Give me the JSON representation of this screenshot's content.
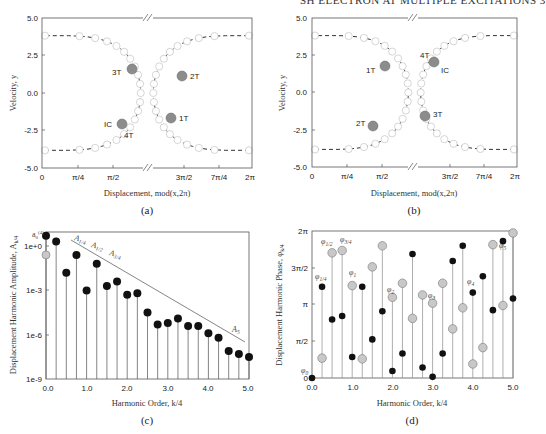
{
  "header": {
    "running_title": "SH ELECTRON AT MULTIPLE EXCITATIONS 3"
  },
  "chart_data": [
    {
      "id": "a",
      "type": "scatter",
      "caption": "(a)",
      "xlabel": "Displacement, mod(x,2π)",
      "ylabel": "Velocity, y",
      "xticks": [
        "0",
        "π/4",
        "π/2",
        "3π/2",
        "7π/4",
        "2π"
      ],
      "yticks": [
        "5.0",
        "2.5",
        "0.0",
        "-2.5",
        "-5.0"
      ],
      "ylim": [
        -5.0,
        5.0
      ],
      "axis_break": true,
      "series": [
        {
          "name": "trajectory (open circles, dashed)",
          "style": "open-circle"
        },
        {
          "name": "Poincaré points",
          "style": "filled-gray"
        }
      ],
      "labels": [
        {
          "text": "3T",
          "x": "≈π/2+0.3",
          "y": 1.6
        },
        {
          "text": "2T",
          "x": "≈3π/2+0.2",
          "y": 2.3
        },
        {
          "text": "IC",
          "x": "≈π/2+0.1",
          "y": -2.0
        },
        {
          "text": "4T",
          "x": "≈π/2+0.1",
          "y": -2.0
        },
        {
          "text": "1T",
          "x": "≈3π/2-0.1",
          "y": -1.7
        }
      ]
    },
    {
      "id": "b",
      "type": "scatter",
      "caption": "(b)",
      "xlabel": "Displacement, mod(x,2π)",
      "ylabel": "Velocity, y",
      "xticks": [
        "0",
        "π/4",
        "π/2",
        "3π/2",
        "7π/4",
        "2π"
      ],
      "yticks": [
        "5.0",
        "2.5",
        "0.0",
        "-2.5",
        "-5.0"
      ],
      "ylim": [
        -5.0,
        5.0
      ],
      "axis_break": true,
      "labels": [
        {
          "text": "1T",
          "x": "≈π/2",
          "y": 1.7
        },
        {
          "text": "4T",
          "x": "≈3π/2-0.1",
          "y": 2.1
        },
        {
          "text": "IC",
          "x": "≈3π/2-0.1",
          "y": 2.1
        },
        {
          "text": "2T",
          "x": "≈π/2-0.2",
          "y": -2.2
        },
        {
          "text": "3T",
          "x": "≈3π/2-0.4",
          "y": -1.6
        }
      ]
    },
    {
      "id": "c",
      "type": "stem",
      "caption": "(c)",
      "xlabel": "Harmonic Order, k/4",
      "ylabel": "Displacement Harmonic Amplitude, A_k/4",
      "xticks": [
        "0.0",
        "1.0",
        "2.0",
        "3.0",
        "4.0",
        "5.0"
      ],
      "yticks": [
        "1e+0",
        "1e-3",
        "1e-6",
        "1e-9"
      ],
      "yscale": "log",
      "ylim": [
        1e-09,
        10
      ],
      "x": [
        0.0,
        0.25,
        0.5,
        0.75,
        1.0,
        1.25,
        1.5,
        1.75,
        2.0,
        2.25,
        2.5,
        2.75,
        3.0,
        3.25,
        3.5,
        3.75,
        4.0,
        4.25,
        4.5,
        4.75,
        5.0
      ],
      "log10_values": [
        0.7,
        0.3,
        -1.8,
        -0.6,
        -3.0,
        -1.2,
        -2.7,
        -2.4,
        -3.3,
        -3.2,
        -4.5,
        -5.3,
        -5.2,
        -4.9,
        -5.4,
        -5.4,
        -5.9,
        -6.2,
        -7.1,
        -7.3,
        -7.5
      ],
      "extra_point": {
        "x": 0.0,
        "log10_value": -0.6,
        "style": "gray",
        "label": "a0^(4)"
      },
      "annotations": [
        "A_1/4",
        "A_1/2",
        "A_3/4",
        "A_5"
      ],
      "trend_line": {
        "from": [
          0.55,
          0.3
        ],
        "to": [
          4.95,
          -6.3
        ]
      }
    },
    {
      "id": "d",
      "type": "stem",
      "caption": "(d)",
      "xlabel": "Harmonic Order, k/4",
      "ylabel": "Displacement Harmonic Phase, φ_k/4",
      "xticks": [
        "0.0",
        "1.0",
        "2.0",
        "3.0",
        "4.0",
        "5.0"
      ],
      "yticks": [
        "2π",
        "3π/2",
        "π",
        "π/2",
        "0"
      ],
      "ylim": [
        0,
        6.2832
      ],
      "x": [
        0.0,
        0.25,
        0.5,
        0.75,
        1.0,
        1.25,
        1.5,
        1.75,
        2.0,
        2.25,
        2.5,
        2.75,
        3.0,
        3.25,
        3.5,
        3.75,
        4.0,
        4.25,
        4.5,
        4.75,
        5.0
      ],
      "series": [
        {
          "name": "gray (case a)",
          "values": [
            0.0,
            0.85,
            5.35,
            5.45,
            3.95,
            0.82,
            4.75,
            5.65,
            3.45,
            4.05,
            2.55,
            3.55,
            3.2,
            4.05,
            2.1,
            3.0,
            0.6,
            1.3,
            5.7,
            3.1,
            6.2
          ]
        },
        {
          "name": "black (case b)",
          "values": [
            0.0,
            3.9,
            2.5,
            2.65,
            0.9,
            3.9,
            1.65,
            2.85,
            0.3,
            1.05,
            5.3,
            0.45,
            0.05,
            1.05,
            5.0,
            5.65,
            3.65,
            4.35,
            2.9,
            5.85,
            3.4
          ]
        }
      ],
      "annotations": [
        "φ0",
        "φ1/4",
        "φ1/2",
        "φ3/4",
        "φ1",
        "φ2",
        "φ3",
        "φ4",
        "φ5"
      ]
    }
  ],
  "labels": {
    "a": {
      "caption": "(a)",
      "xlabel": "Displacement, mod(x,2π)",
      "ylabel": "Velocity, y",
      "yticks": [
        "5.0",
        "2.5",
        "0.0",
        "-2.5",
        "-5.0"
      ],
      "xticks": [
        "0",
        "π/4",
        "π/2",
        "3π/2",
        "7π/4",
        "2π"
      ],
      "pts": [
        "3T",
        "2T",
        "IC",
        "4T",
        "1T"
      ]
    },
    "b": {
      "caption": "(b)",
      "xlabel": "Displacement, mod(x,2π)",
      "ylabel": "Velocity, y",
      "yticks": [
        "5.0",
        "2.5",
        "0.0",
        "-2.5",
        "-5.0"
      ],
      "xticks": [
        "0",
        "π/4",
        "π/2",
        "3π/2",
        "7π/4",
        "2π"
      ],
      "pts": [
        "1T",
        "4T",
        "IC",
        "2T",
        "3T"
      ]
    },
    "c": {
      "caption": "(c)",
      "xlabel": "Harmonic Order, k/4",
      "ylabel": "Displacement Harmonic Amplitude, A",
      "ylabel_sub": "k/4",
      "yticks": [
        "1e+0",
        "1e-3",
        "1e-6",
        "1e-9"
      ],
      "xticks": [
        "0.0",
        "1.0",
        "2.0",
        "3.0",
        "4.0",
        "5.0"
      ],
      "a0": "a",
      "a0_sub": "0",
      "a0_sup": "(4)",
      "ann": [
        "A",
        "A",
        "A",
        "A"
      ],
      "ann_sub": [
        "1/4",
        "1/2",
        "3/4",
        "5"
      ]
    },
    "d": {
      "caption": "(d)",
      "xlabel": "Harmonic Order, k/4",
      "ylabel": "Displacement Harmonic Phase, φ",
      "ylabel_sub": "k/4",
      "yticks": [
        "2π",
        "3π/2",
        "π",
        "π/2",
        "0"
      ],
      "xticks": [
        "0.0",
        "1.0",
        "2.0",
        "3.0",
        "4.0",
        "5.0"
      ],
      "ann": [
        "φ",
        "φ",
        "φ",
        "φ",
        "φ",
        "φ",
        "φ",
        "φ",
        "φ"
      ],
      "ann_sub": [
        "0",
        "1/4",
        "1/2",
        "3/4",
        "1",
        "2",
        "3",
        "4",
        "5"
      ]
    }
  },
  "colors": {
    "axis": "#555555",
    "gray_marker": "#8c8c8c",
    "light_gray_marker": "#c8c8c8",
    "black_marker": "#111111",
    "stem": "#666666",
    "dash": "#333333"
  }
}
